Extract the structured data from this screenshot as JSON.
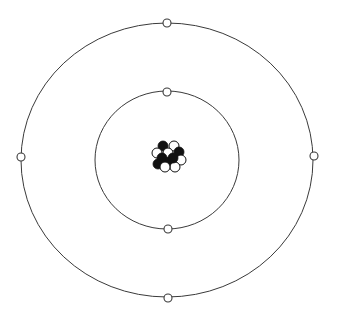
{
  "diagram": {
    "type": "atom-model",
    "background": "#ffffff",
    "line_color": "#3a3a3a",
    "orbits": [
      {
        "name": "inner-shell",
        "cx": 167,
        "cy": 160,
        "rx": 72,
        "ry": 69,
        "electrons": [
          {
            "x": 167,
            "y": 92
          },
          {
            "x": 168,
            "y": 229
          }
        ]
      },
      {
        "name": "outer-shell",
        "cx": 167,
        "cy": 160,
        "rx": 146,
        "ry": 137,
        "electrons": [
          {
            "x": 167,
            "y": 23
          },
          {
            "x": 21,
            "y": 157
          },
          {
            "x": 314,
            "y": 156
          },
          {
            "x": 168,
            "y": 298
          }
        ]
      }
    ],
    "nucleus": {
      "cx": 168,
      "cy": 156,
      "particles": [
        {
          "x": 163,
          "y": 146,
          "kind": "dark"
        },
        {
          "x": 174,
          "y": 146,
          "kind": "light"
        },
        {
          "x": 157,
          "y": 153,
          "kind": "light"
        },
        {
          "x": 179,
          "y": 152,
          "kind": "dark"
        },
        {
          "x": 168,
          "y": 153,
          "kind": "light"
        },
        {
          "x": 162,
          "y": 158,
          "kind": "dark"
        },
        {
          "x": 181,
          "y": 160,
          "kind": "light"
        },
        {
          "x": 158,
          "y": 164,
          "kind": "dark"
        },
        {
          "x": 170,
          "y": 162,
          "kind": "dark"
        },
        {
          "x": 175,
          "y": 167,
          "kind": "light"
        },
        {
          "x": 165,
          "y": 167,
          "kind": "light"
        },
        {
          "x": 173,
          "y": 158,
          "kind": "dark"
        }
      ],
      "particle_radius": 5
    }
  }
}
